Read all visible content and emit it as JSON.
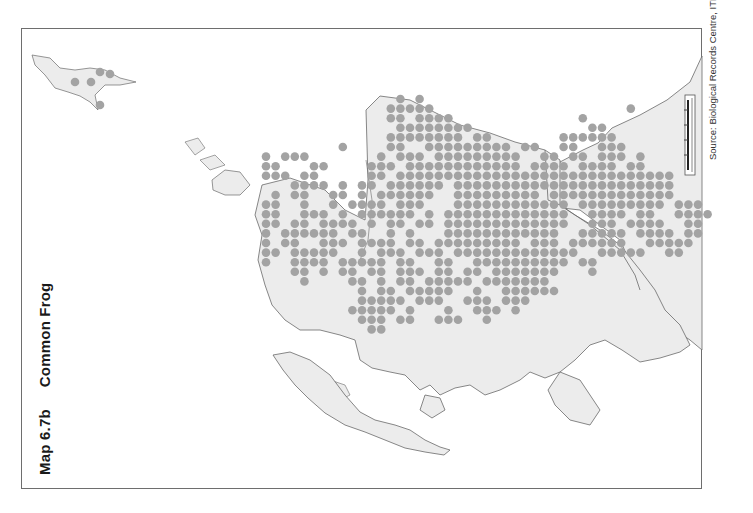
{
  "map": {
    "title_number": "Map 6.7b",
    "title_species": "Common Frog",
    "source": "Source: Biological Records Centre, ITE",
    "colors": {
      "land": "#ececec",
      "coast": "#6a6a6a",
      "dot": "#a3a3a3",
      "frame": "#6e6e6e",
      "background": "#ffffff"
    },
    "grid": {
      "x0": 266,
      "y0": 99,
      "step": 9.6,
      "radius": 4.3
    },
    "dot_rows": [
      "..............#.#..............................",
      ".............#####....................#........",
      ".............##.####.............#............",
      "..............########............##...........",
      ".............########.##.......######.........",
      "........#....##..#########.##..##..###........",
      "#.###.......#.###.#########..##.##.###.#.....",
      "##...##....###.############.####.####.##.....",
      "###.##.....##.#############################...",
      "...####.#.##.######.#######################...",
      ".#.##..##.#.######..#########.#############...",
      "##..#..#.####.###...############.#########.###.",
      "##..###.#.######.#.#############..####.##..####",
      "##.##.####.#.##.##.#############..###.####..##.",
      "#.######.##..#.#...############..#####.####.##.",
      "#.##..###.####.##.#########.###.######..#####..",
      "##.#####..#.###.###.#############..#####..##...",
      "#..####.#####.##..##..##########.##..........",
      "...##.#.##.##.###.##.##.#######...#...........",
      "....#....##.#.##.#####.#######................",
      "..........#.##.#####..#..######................",
      "..........#####.###..###.###....................",
      ".........#####.#...#..###.#.....................",
      "..........###.##..###..#........................",
      "...........##...................................."
    ],
    "shetland_dots": [
      [
        75,
        82
      ],
      [
        91,
        82
      ],
      [
        100,
        72
      ],
      [
        110,
        74
      ],
      [
        100,
        105
      ]
    ],
    "scale_bar": {
      "ticks": 5
    }
  }
}
